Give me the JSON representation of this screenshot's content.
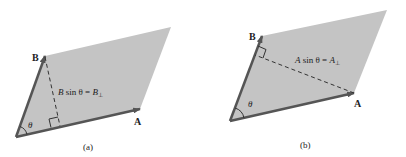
{
  "colors": {
    "fill": "#c4c4c4",
    "vector": "#555555",
    "line": "#333333",
    "text": "#222222"
  },
  "panels": [
    {
      "id": "a",
      "caption": "(a)",
      "vector_a_label": "A",
      "vector_b_label": "B",
      "angle_label": "θ",
      "height_label_main": "B",
      "height_label_mid": " sin θ = ",
      "height_label_sym": "B",
      "height_label_sub": "⊥"
    },
    {
      "id": "b",
      "caption": "(b)",
      "vector_a_label": "A",
      "vector_b_label": "B",
      "angle_label": "θ",
      "height_label_main": "A",
      "height_label_mid": " sin θ = ",
      "height_label_sym": "A",
      "height_label_sub": "⊥"
    }
  ]
}
